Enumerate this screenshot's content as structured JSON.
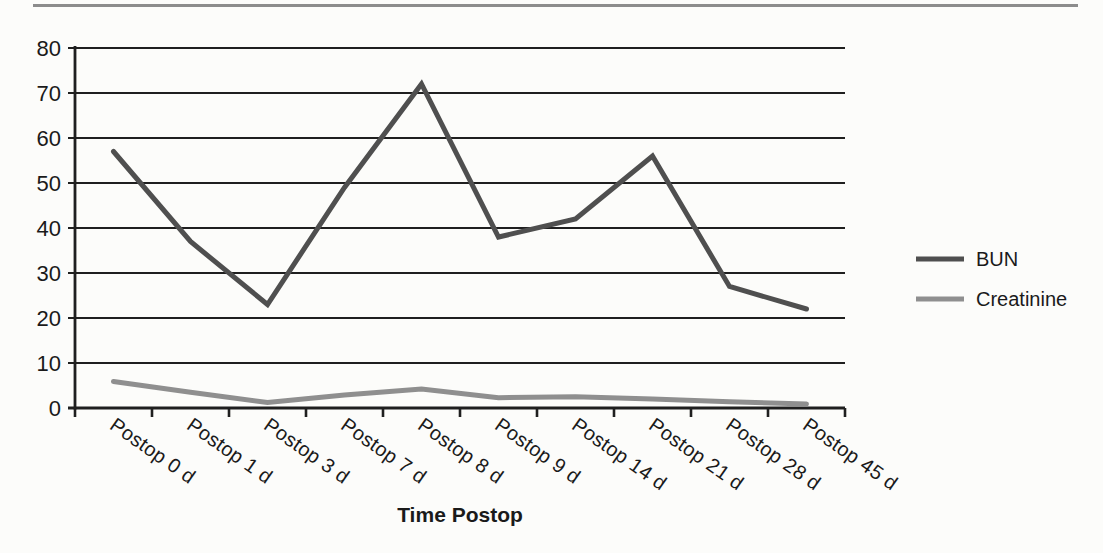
{
  "page": {
    "background_color": "#fcfcfa",
    "top_rule_color": "#8c8c8c"
  },
  "chart_data": {
    "type": "line",
    "title": "",
    "categories": [
      "Postop 0 d",
      "Postop 1 d",
      "Postop 3 d",
      "Postop 7 d",
      "Postop 8 d",
      "Postop 9 d",
      "Postop 14 d",
      "Postop 21 d",
      "Postop 28 d",
      "Postop 45 d"
    ],
    "series": [
      {
        "name": "BUN",
        "color": "#4f4f4f",
        "values": [
          57,
          37,
          23,
          49,
          72,
          38,
          42,
          56,
          27,
          22
        ]
      },
      {
        "name": "Creatinine",
        "color": "#8f8f8f",
        "values": [
          5.9,
          3.5,
          1.2,
          2.9,
          4.2,
          2.3,
          2.5,
          2.0,
          1.4,
          0.9
        ]
      }
    ],
    "xlabel": "Time Postop",
    "ylabel": "",
    "ylim": [
      0,
      80
    ],
    "ytick_step": 10,
    "grid": "horizontal",
    "gridline_color": "#1f1f1f",
    "axis_color": "#1f1f1f",
    "text_color": "#1a1a1a",
    "legend_position": "right-middle",
    "x_tick_label_rotation_deg": 35
  }
}
